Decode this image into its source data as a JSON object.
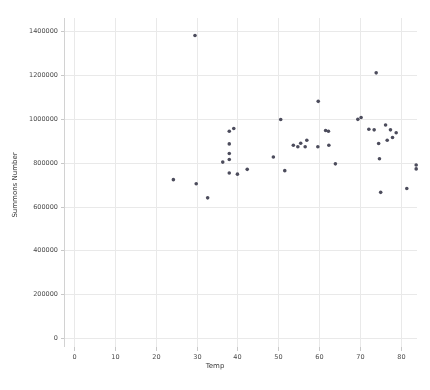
{
  "chart_data": {
    "type": "scatter",
    "title": "",
    "xlabel": "Temp",
    "ylabel": "Summons Number",
    "xlim": [
      -2.5,
      84
    ],
    "ylim": [
      -40000,
      1460000
    ],
    "xticks": [
      0,
      10,
      20,
      30,
      40,
      50,
      60,
      70,
      80
    ],
    "xticklabels": [
      "0",
      "10",
      "20",
      "30",
      "40",
      "50",
      "60",
      "70",
      "80"
    ],
    "yticks": [
      0,
      200000,
      400000,
      600000,
      800000,
      1000000,
      1200000,
      1400000
    ],
    "yticklabels": [
      "0",
      "200000",
      "400000",
      "600000",
      "800000",
      "1000000",
      "1200000",
      "1400000"
    ],
    "grid": true,
    "grid_color": "#e9e9e9",
    "marker_color": "#4c4c5c",
    "marker_size": 2.6,
    "legend": null,
    "points": [
      {
        "x": 24.3,
        "y": 723000
      },
      {
        "x": 29.6,
        "y": 1380000
      },
      {
        "x": 29.9,
        "y": 704000
      },
      {
        "x": 32.7,
        "y": 640000
      },
      {
        "x": 36.4,
        "y": 803000
      },
      {
        "x": 38.0,
        "y": 944000
      },
      {
        "x": 39.1,
        "y": 956000
      },
      {
        "x": 38.0,
        "y": 886000
      },
      {
        "x": 38.0,
        "y": 842000
      },
      {
        "x": 38.0,
        "y": 815000
      },
      {
        "x": 38.0,
        "y": 753000
      },
      {
        "x": 40.0,
        "y": 748000
      },
      {
        "x": 42.4,
        "y": 770000
      },
      {
        "x": 48.8,
        "y": 826000
      },
      {
        "x": 50.6,
        "y": 997000
      },
      {
        "x": 51.6,
        "y": 764000
      },
      {
        "x": 53.7,
        "y": 880000
      },
      {
        "x": 54.8,
        "y": 873000
      },
      {
        "x": 55.5,
        "y": 889000
      },
      {
        "x": 56.6,
        "y": 873000
      },
      {
        "x": 57.0,
        "y": 903000
      },
      {
        "x": 59.8,
        "y": 1080000
      },
      {
        "x": 59.7,
        "y": 873000
      },
      {
        "x": 61.6,
        "y": 947000
      },
      {
        "x": 62.3,
        "y": 944000
      },
      {
        "x": 62.4,
        "y": 880000
      },
      {
        "x": 70.3,
        "y": 1006000
      },
      {
        "x": 69.5,
        "y": 998000
      },
      {
        "x": 72.2,
        "y": 953000
      },
      {
        "x": 74.0,
        "y": 1210000
      },
      {
        "x": 73.5,
        "y": 950000
      },
      {
        "x": 76.3,
        "y": 972000
      },
      {
        "x": 77.5,
        "y": 950000
      },
      {
        "x": 78.9,
        "y": 937000
      },
      {
        "x": 78.0,
        "y": 915000
      },
      {
        "x": 76.7,
        "y": 903000
      },
      {
        "x": 74.6,
        "y": 888000
      },
      {
        "x": 74.8,
        "y": 818000
      },
      {
        "x": 83.8,
        "y": 790000
      },
      {
        "x": 83.8,
        "y": 772000
      },
      {
        "x": 75.1,
        "y": 665000
      },
      {
        "x": 81.5,
        "y": 683000
      },
      {
        "x": 64.0,
        "y": 795000
      }
    ]
  }
}
